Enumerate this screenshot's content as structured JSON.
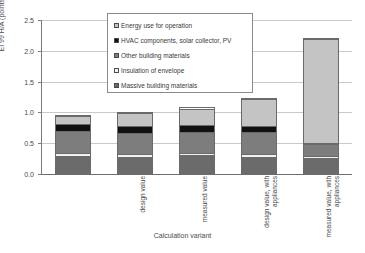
{
  "chart_data": {
    "type": "bar",
    "subtype": "stacked-bar",
    "title": "",
    "xlabel": "Calculation variant",
    "ylabel": "EI 99 H/A (points/m²a)",
    "ylim": [
      0.0,
      2.5
    ],
    "yticks": [
      "0.0",
      "0.5",
      "1.0",
      "1.5",
      "2.0",
      "2.5"
    ],
    "ytick_values": [
      0.0,
      0.5,
      1.0,
      1.5,
      2.0,
      2.5
    ],
    "grid": true,
    "legend_position": "upper-center",
    "categories": [
      "design value",
      "measured value",
      "design value, with appliances",
      "measured value, with appliances",
      "Reference (without appliances)"
    ],
    "series": [
      {
        "name": "Massive building materials",
        "color": "#6b6b6b",
        "values": [
          0.29,
          0.27,
          0.31,
          0.27,
          0.24
        ]
      },
      {
        "name": "Insulation of envelope",
        "color": "#f2f2f2",
        "values": [
          0.04,
          0.05,
          0.03,
          0.04,
          0.04
        ]
      },
      {
        "name": "Other building materials",
        "color": "#7d7d7d",
        "values": [
          0.37,
          0.35,
          0.34,
          0.37,
          0.19
        ]
      },
      {
        "name": "HVAC components, solar collector, PV",
        "color": "#111111",
        "values": [
          0.12,
          0.12,
          0.12,
          0.11,
          0.03
        ]
      },
      {
        "name": "Energy use for operation",
        "color": "#c4c4c4",
        "values": [
          0.13,
          0.21,
          0.28,
          0.45,
          1.7
        ]
      }
    ],
    "totals": [
      0.95,
      1.0,
      1.08,
      1.24,
      2.2
    ]
  },
  "legend": {
    "items": [
      {
        "label": "Energy use for operation",
        "color": "#c4c4c4"
      },
      {
        "label": "HVAC components, solar collector, PV",
        "color": "#111111"
      },
      {
        "label": "Other building materials",
        "color": "#7d7d7d"
      },
      {
        "label": "Insulation of envelope",
        "color": "#f2f2f2"
      },
      {
        "label": "Massive building materials",
        "color": "#6b6b6b"
      }
    ]
  }
}
